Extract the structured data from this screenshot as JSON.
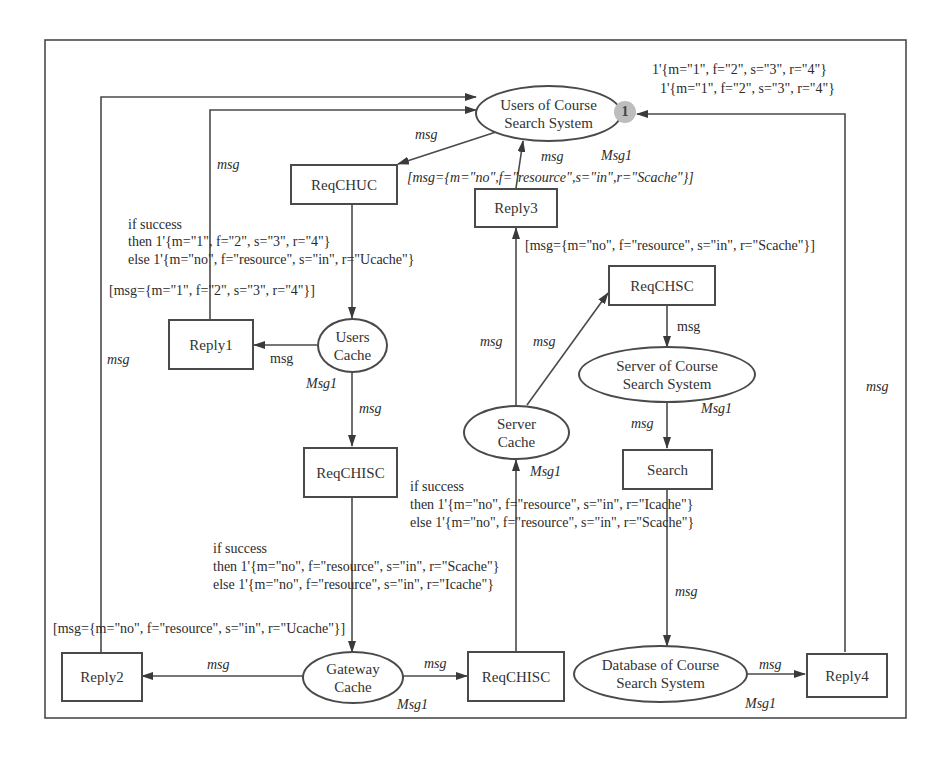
{
  "diagram": {
    "type": "colored-petri-net",
    "places": {
      "users_css": {
        "line1": "Users of Course",
        "line2": "Search System",
        "token": "1"
      },
      "users_cache": {
        "line1": "Users",
        "line2": "Cache"
      },
      "server_cache": {
        "line1": "Server",
        "line2": "Cache"
      },
      "server_css": {
        "line1": "Server of Course",
        "line2": "Search System"
      },
      "gateway_cache": {
        "line1": "Gateway",
        "line2": "Cache"
      },
      "database_css": {
        "line1": "Database of Course",
        "line2": "Search System"
      }
    },
    "transitions": {
      "reqchuc": "ReqCHUC",
      "reply3": "Reply3",
      "reqchsc": "ReqCHSC",
      "reply1": "Reply1",
      "reqchisc_top": "ReqCHISC",
      "search": "Search",
      "reply2": "Reply2",
      "reqchisc_bottom": "ReqCHISC",
      "reply4": "Reply4"
    },
    "initial_marking": {
      "line1": "1'{m=\"1\", f=\"2\", s=\"3\", r=\"4\"}",
      "line2": "1'{m=\"1\", f=\"2\", s=\"3\", r=\"4\"}"
    },
    "arc_labels": {
      "msg": "msg",
      "msg1": "Msg1"
    },
    "guards": {
      "reply3": "[msg={m=\"no\",f=\"resource\",s=\"in\",r=\"Scache\"}]",
      "reqchsc": "[msg={m=\"no\", f=\"resource\", s=\"in\", r=\"Scache\"}]",
      "reply1": "[msg={m=\"1\", f=\"2\", s=\"3\", r=\"4\"}]",
      "reply2": "[msg={m=\"no\", f=\"resource\", s=\"in\", r=\"Ucache\"}]"
    },
    "expressions": {
      "reqchuc_out": {
        "l1": "if success",
        "l2": "then 1'{m=\"1\", f=\"2\", s=\"3\", r=\"4\"}",
        "l3": "else 1'{m=\"no\", f=\"resource\", s=\"in\", r=\"Ucache\"}"
      },
      "reqchisc_bottom_out": {
        "l1": "if success",
        "l2": "then 1'{m=\"no\", f=\"resource\", s=\"in\", r=\"Icache\"}",
        "l3": "else 1'{m=\"no\", f=\"resource\", s=\"in\", r=\"Scache\"}"
      },
      "reqchisc_top_out": {
        "l1": "if success",
        "l2": "then 1'{m=\"no\", f=\"resource\", s=\"in\", r=\"Scache\"}",
        "l3": "else 1'{m=\"no\", f=\"resource\", s=\"in\", r=\"Icache\"}"
      }
    }
  }
}
